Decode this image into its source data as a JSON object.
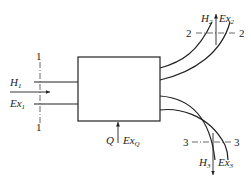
{
  "diagram": {
    "type": "control-volume-flow",
    "colors": {
      "stroke": "#222222",
      "background": "#ffffff"
    },
    "inlet": {
      "section": "1",
      "labels": {
        "enthalpy": "H",
        "enthalpy_sub": "1",
        "exergy": "Ex",
        "exergy_sub": "1"
      }
    },
    "outlet_top": {
      "section": "2",
      "labels": {
        "enthalpy": "H",
        "enthalpy_sub": "2",
        "exergy": "Ex",
        "exergy_sub": "2"
      }
    },
    "outlet_bottom": {
      "section": "3",
      "labels": {
        "enthalpy": "H",
        "enthalpy_sub": "3",
        "exergy": "Ex",
        "exergy_sub": "3"
      }
    },
    "heat_input": {
      "labels": {
        "heat": "Q",
        "exergy": "Ex",
        "exergy_sub": "Q"
      }
    }
  }
}
